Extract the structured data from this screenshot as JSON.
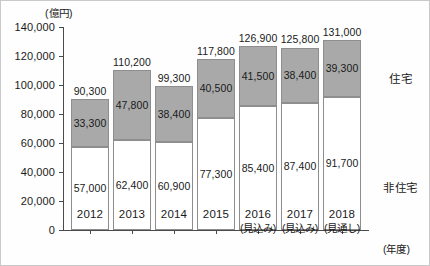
{
  "chart_data": {
    "type": "bar",
    "title": "",
    "unit_label": "(億円)",
    "xlabel": "(年度)",
    "ylabel": "",
    "stacked": true,
    "grid": false,
    "legend_position": "right",
    "ylim": [
      0,
      140000
    ],
    "yticks": [
      0,
      20000,
      40000,
      60000,
      80000,
      100000,
      120000,
      140000
    ],
    "ytick_labels": [
      "0",
      "20,000",
      "40,000",
      "60,000",
      "80,000",
      "100,000",
      "120,000",
      "140,000"
    ],
    "categories": [
      "2012",
      "2013",
      "2014",
      "2015",
      "2016",
      "2017",
      "2018"
    ],
    "category_notes": [
      "",
      "",
      "",
      "",
      "(見込み)",
      "(見込み)",
      "(見通し)"
    ],
    "series": [
      {
        "name": "非住宅",
        "color": "#ffffff",
        "values": [
          57000,
          62400,
          60900,
          77300,
          85400,
          87400,
          91700
        ],
        "value_labels": [
          "57,000",
          "62,400",
          "60,900",
          "77,300",
          "85,400",
          "87,400",
          "91,700"
        ]
      },
      {
        "name": "住宅",
        "color": "#a9a9a9",
        "values": [
          33300,
          47800,
          38400,
          40500,
          41500,
          38400,
          39300
        ],
        "value_labels": [
          "33,300",
          "47,800",
          "38,400",
          "40,500",
          "41,500",
          "38,400",
          "39,300"
        ]
      }
    ],
    "totals": [
      90300,
      110200,
      99300,
      117800,
      126900,
      125800,
      131000
    ],
    "total_labels": [
      "90,300",
      "110,200",
      "99,300",
      "117,800",
      "126,900",
      "125,800",
      "131,000"
    ],
    "legend": [
      {
        "label": "住宅",
        "color": "#a9a9a9"
      },
      {
        "label": "非住宅",
        "color": "#ffffff"
      }
    ]
  }
}
